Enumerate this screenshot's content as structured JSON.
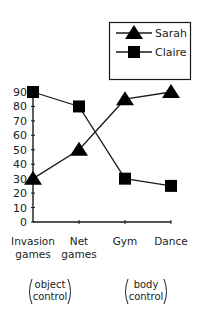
{
  "chart_data": {
    "type": "line",
    "title": "",
    "xlabel": "",
    "ylabel": "",
    "ylim": [
      0,
      90
    ],
    "yticks": [
      0,
      10,
      20,
      30,
      40,
      50,
      60,
      70,
      80,
      90
    ],
    "categories": [
      "Invasion games",
      "Net games",
      "Gym",
      "Dance"
    ],
    "category_lines": [
      [
        "Invasion",
        "games"
      ],
      [
        "Net",
        "games"
      ],
      [
        "Gym"
      ],
      [
        "Dance"
      ]
    ],
    "series": [
      {
        "name": "Sarah",
        "marker": "triangle",
        "values": [
          30,
          50,
          85,
          90
        ]
      },
      {
        "name": "Claire",
        "marker": "square",
        "values": [
          90,
          80,
          30,
          25
        ]
      }
    ],
    "legend_position": "top-right",
    "grid": false,
    "group_labels": [
      {
        "lines": [
          "object",
          "control"
        ],
        "covers": [
          "Invasion games",
          "Net games"
        ]
      },
      {
        "lines": [
          "body",
          "control"
        ],
        "covers": [
          "Gym",
          "Dance"
        ]
      }
    ]
  },
  "legend": {
    "items": [
      {
        "label": "Sarah",
        "marker": "triangle"
      },
      {
        "label": "Claire",
        "marker": "square"
      }
    ]
  },
  "colors": {
    "line": "#1a1a1a",
    "marker": "#000000",
    "text": "#222222"
  }
}
